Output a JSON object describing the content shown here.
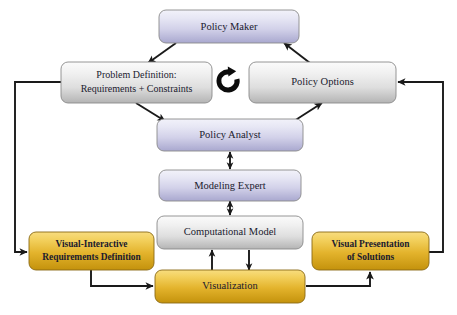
{
  "diagram": {
    "type": "flow-diagram",
    "background_color": "#ffffff",
    "palette": {
      "purple_light": "#e9e9f6",
      "purple_dark": "#a9a8cf",
      "gray_light": "#f3f3f3",
      "gray_dark": "#b9b9b9",
      "gold_light": "#f6d870",
      "gold_dark": "#c9960f",
      "line": "#1a1a1a",
      "text": "#1a1a2e"
    },
    "nodes": [
      {
        "id": "policy-maker",
        "label": "Policy Maker",
        "lines": [
          "Policy Maker"
        ],
        "style": "purple",
        "x": 159,
        "y": 10,
        "w": 140,
        "h": 33
      },
      {
        "id": "problem-definition",
        "label": "Problem Definition: Requirements + Constraints",
        "lines": [
          "Problem Definition:",
          "Requirements + Constraints"
        ],
        "style": "gray",
        "x": 61,
        "y": 62,
        "w": 151,
        "h": 41
      },
      {
        "id": "policy-options",
        "label": "Policy Options",
        "lines": [
          "Policy Options"
        ],
        "style": "gray",
        "x": 249,
        "y": 62,
        "w": 147,
        "h": 41
      },
      {
        "id": "policy-analyst",
        "label": "Policy Analyst",
        "lines": [
          "Policy Analyst"
        ],
        "style": "purple",
        "x": 157,
        "y": 119,
        "w": 146,
        "h": 32
      },
      {
        "id": "modeling-expert",
        "label": "Modeling Expert",
        "lines": [
          "Modeling Expert"
        ],
        "style": "purple",
        "x": 159,
        "y": 170,
        "w": 142,
        "h": 31
      },
      {
        "id": "computational-model",
        "label": "Computational Model",
        "lines": [
          "Computational Model"
        ],
        "style": "gray",
        "x": 157,
        "y": 216,
        "w": 146,
        "h": 33
      },
      {
        "id": "visual-interactive-requirements",
        "label": "Visual-Interactive Requirements Definition",
        "lines": [
          "Visual-Interactive",
          "Requirements Definition"
        ],
        "style": "gold",
        "x": 29,
        "y": 232,
        "w": 125,
        "h": 38
      },
      {
        "id": "visual-presentation",
        "label": "Visual Presentation of Solutions",
        "lines": [
          "Visual Presentation",
          "of Solutions"
        ],
        "style": "gold",
        "x": 312,
        "y": 232,
        "w": 117,
        "h": 38
      },
      {
        "id": "visualization",
        "label": "Visualization",
        "lines": [
          "Visualization"
        ],
        "style": "gold",
        "x": 155,
        "y": 270,
        "w": 150,
        "h": 33
      }
    ],
    "icons": [
      {
        "id": "cycle-icon",
        "name": "cycle-refresh-icon",
        "cx": 228,
        "cy": 81,
        "r": 12
      }
    ],
    "edges": [
      {
        "id": "e1",
        "from": "policy-maker",
        "to": "problem-definition",
        "kind": "diagonal"
      },
      {
        "id": "e2",
        "from": "policy-options",
        "to": "policy-maker",
        "kind": "diagonal"
      },
      {
        "id": "e3",
        "from": "problem-definition",
        "to": "policy-analyst",
        "kind": "diagonal"
      },
      {
        "id": "e4",
        "from": "policy-analyst",
        "to": "policy-options",
        "kind": "diagonal"
      },
      {
        "id": "e5",
        "from": "policy-analyst",
        "to": "modeling-expert",
        "kind": "bidirectional-vertical"
      },
      {
        "id": "e6",
        "from": "modeling-expert",
        "to": "computational-model",
        "kind": "bidirectional-vertical"
      },
      {
        "id": "e7",
        "from": "visualization",
        "to": "computational-model",
        "kind": "vertical-up"
      },
      {
        "id": "e8",
        "from": "computational-model",
        "to": "visualization",
        "kind": "vertical-down"
      },
      {
        "id": "e9",
        "from": "visual-interactive-requirements",
        "to": "visualization",
        "kind": "elbow"
      },
      {
        "id": "e10",
        "from": "visualization",
        "to": "visual-presentation",
        "kind": "elbow"
      },
      {
        "id": "e11",
        "from": "problem-definition",
        "to": "visual-interactive-requirements",
        "kind": "left-loop"
      },
      {
        "id": "e12",
        "from": "visual-presentation",
        "to": "policy-options",
        "kind": "right-loop"
      }
    ]
  }
}
